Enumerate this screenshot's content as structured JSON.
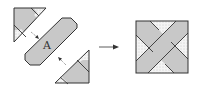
{
  "diagram": {
    "piece_label": "A",
    "colors": {
      "band_fill": "#c8c8c8",
      "outline": "#333333",
      "dot_fill": "#f4f4f4",
      "dot_color": "#9a9a9a",
      "background": "#ffffff"
    },
    "parts": [
      {
        "id": "top-left-triangle-piece",
        "description": "corner triangle with gray band and dotted corners"
      },
      {
        "id": "center-band-piece",
        "label": "A",
        "description": "diagonal gray strip with pointed ends"
      },
      {
        "id": "bottom-right-triangle-piece",
        "description": "corner triangle with gray band and dotted corners"
      },
      {
        "id": "assembly-arrow",
        "description": "arrow pointing right"
      },
      {
        "id": "assembled-square",
        "description": "square with crossing gray bands and dotted triangles"
      }
    ]
  }
}
